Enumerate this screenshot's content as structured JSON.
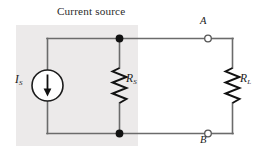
{
  "figure": {
    "type": "circuit-schematic",
    "title": "Current source",
    "colors": {
      "wire": "#6b6b6b",
      "wire_dark": "#4a4a4a",
      "node_dot": "#111111",
      "terminal_fill": "#ffffff",
      "terminal_stroke": "#555555",
      "shaded_region": "#eceaea",
      "text": "#1a1a1a"
    }
  },
  "labels": {
    "title": "Current source",
    "current_source": {
      "symbol": "I",
      "subscript": "S"
    },
    "source_resistor": {
      "symbol": "R",
      "subscript": "S"
    },
    "load_resistor": {
      "symbol": "R",
      "subscript": "L"
    },
    "terminal_a": "A",
    "terminal_b": "B"
  },
  "components": [
    {
      "name": "ideal-current-source",
      "label": "IS",
      "kind": "circle-with-down-arrow",
      "direction": "down"
    },
    {
      "name": "source-resistance",
      "label": "RS",
      "kind": "zigzag-resistor",
      "orientation": "vertical"
    },
    {
      "name": "load-resistance",
      "label": "RL",
      "kind": "zigzag-resistor",
      "orientation": "vertical"
    }
  ],
  "terminals": [
    {
      "name": "terminal-a",
      "label": "A",
      "style": "open-circle"
    },
    {
      "name": "terminal-b",
      "label": "B",
      "style": "open-circle"
    }
  ],
  "nodes": [
    {
      "name": "junction-top",
      "style": "filled-dot"
    },
    {
      "name": "junction-bottom",
      "style": "filled-dot"
    }
  ]
}
